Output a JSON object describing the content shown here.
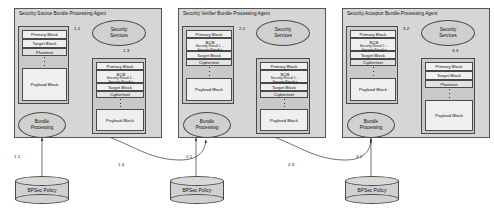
{
  "diagram": {
    "labels": {
      "security_services": "Security\nServices",
      "bundle_processing": "Bundle\nProcessing",
      "policy_store": "BPSec Policy",
      "primary_block": "Primary Block",
      "target_block": "Target Block",
      "payload_block": "Payload Block",
      "plaintext": "Plaintext",
      "ciphertext": "Ciphertext",
      "bcb": "BCB",
      "security_result_1": "Security Result 1 ...",
      "security_result_n": "Security Result n"
    },
    "panels": [
      {
        "id": "source",
        "title": "Security Source Bundle Processing Agent",
        "services_label": "Security Services",
        "processing_label": "Bundle Processing",
        "policy_label": "BPSec Policy",
        "input_bundle": {
          "primary": "Primary Block",
          "target": "Target Block",
          "target_content": "Plaintext",
          "payload": "Payload Block",
          "has_bcb": false
        },
        "output_bundle": {
          "primary": "Primary Block",
          "bcb": "BCB",
          "result_1": "Security Result 1 ...",
          "result_n": "Security Result n",
          "target": "Target Block",
          "target_content": "Ciphertext",
          "payload": "Payload Block",
          "has_bcb": true
        },
        "steps": {
          "policy_to_processing": "1.1",
          "bundle_to_services": "1.2",
          "services_to_bundle": "1.3",
          "processing_out": "1.4"
        }
      },
      {
        "id": "verifier",
        "title": "Security Verifier Bundle Processing Agent",
        "services_label": "Security Services",
        "processing_label": "Bundle Processing",
        "policy_label": "BPSec Policy",
        "input_bundle": {
          "primary": "Primary Block",
          "bcb": "BCB",
          "result_1": "Security Result 1 ...",
          "result_n": "Security Result n",
          "target": "Target Block",
          "target_content": "Ciphertext",
          "payload": "Payload Block",
          "has_bcb": true
        },
        "output_bundle": {
          "primary": "Primary Block",
          "bcb": "BCB",
          "result_1": "Security Result 1 ...",
          "result_n": "Security Result n",
          "target": "Target Block",
          "target_content": "Ciphertext",
          "payload": "Payload Block",
          "has_bcb": true
        },
        "steps": {
          "policy_to_processing": "2.1",
          "bundle_to_services": "2.2",
          "processing_out": "2.3"
        }
      },
      {
        "id": "acceptor",
        "title": "Security Acceptor Bundle Processing Agent",
        "services_label": "Security Services",
        "processing_label": "Bundle Processing",
        "policy_label": "BPSec Policy",
        "input_bundle": {
          "primary": "Primary Block",
          "bcb": "BCB",
          "result_1": "Security Result 1 ...",
          "result_n": "Security Result n",
          "target": "Target Block",
          "target_content": "Ciphertext",
          "payload": "Payload Block",
          "has_bcb": true
        },
        "output_bundle": {
          "primary": "Primary Block",
          "target": "Target Block",
          "target_content": "Plaintext",
          "payload": "Payload Block",
          "has_bcb": false
        },
        "steps": {
          "policy_to_processing": "3.1",
          "bundle_to_services": "3.2",
          "services_to_bundle": "3.3"
        }
      }
    ],
    "colors": {
      "panel_fill": "#d6d6d6",
      "bundle_fill": "#c9c9c9",
      "block_fill": "#efefef",
      "ellipse_fill": "#d0d0d0",
      "stroke": "#4a4a4a"
    }
  }
}
